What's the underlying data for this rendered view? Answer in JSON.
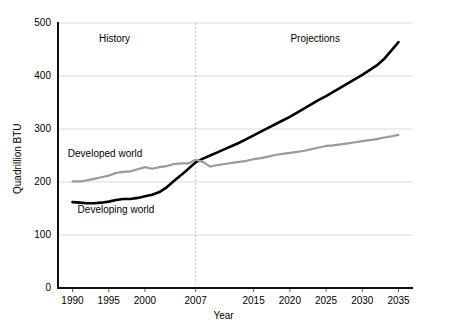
{
  "chart_data": {
    "type": "line",
    "title": "",
    "xlabel": "Year",
    "ylabel": "Quadrillion BTU",
    "xlim": [
      1988,
      2037
    ],
    "ylim": [
      0,
      500
    ],
    "grid": true,
    "legend_position": "inline-annotations",
    "x_ticks": [
      1990,
      1995,
      2000,
      2007,
      2015,
      2020,
      2025,
      2030,
      2035
    ],
    "x_tick_labels": [
      "1990",
      "1995",
      "2000",
      "2007",
      "2015",
      "2020",
      "2025",
      "2030",
      "2035"
    ],
    "y_ticks": [
      0,
      100,
      200,
      300,
      400,
      500
    ],
    "y_tick_labels": [
      "0",
      "100",
      "200",
      "300",
      "400",
      "500"
    ],
    "divider_x": 2007,
    "annotations": [
      {
        "text": "History",
        "x": 1995.8,
        "y": 470
      },
      {
        "text": "Projections",
        "x": 2023.5,
        "y": 470
      },
      {
        "text": "Developed world",
        "x": 1994.5,
        "y": 252
      },
      {
        "text": "Developing world",
        "x": 1996.0,
        "y": 148
      }
    ],
    "series": [
      {
        "name": "Developing world",
        "color": "#000000",
        "width": 2.6,
        "x": [
          1990,
          1991,
          1992,
          1993,
          1994,
          1995,
          1996,
          1997,
          1998,
          1999,
          2000,
          2001,
          2002,
          2003,
          2004,
          2005,
          2006,
          2007,
          2008,
          2009,
          2010,
          2011,
          2012,
          2013,
          2014,
          2015,
          2016,
          2017,
          2018,
          2019,
          2020,
          2021,
          2022,
          2023,
          2024,
          2025,
          2026,
          2027,
          2028,
          2029,
          2030,
          2031,
          2032,
          2033,
          2034,
          2035
        ],
        "values": [
          162,
          161,
          160,
          160,
          161,
          163,
          166,
          168,
          168,
          170,
          173,
          176,
          181,
          190,
          202,
          213,
          225,
          237,
          244,
          250,
          256,
          262,
          268,
          274,
          281,
          288,
          295,
          302,
          309,
          316,
          323,
          331,
          339,
          347,
          355,
          362,
          370,
          378,
          386,
          394,
          402,
          411,
          420,
          432,
          448,
          464
        ]
      },
      {
        "name": "Developed world",
        "color": "#9a9a9a",
        "width": 2.2,
        "x": [
          1990,
          1991,
          1992,
          1993,
          1994,
          1995,
          1996,
          1997,
          1998,
          1999,
          2000,
          2001,
          2002,
          2003,
          2004,
          2005,
          2006,
          2007,
          2008,
          2009,
          2010,
          2011,
          2012,
          2013,
          2014,
          2015,
          2016,
          2017,
          2018,
          2019,
          2020,
          2021,
          2022,
          2023,
          2024,
          2025,
          2026,
          2027,
          2028,
          2029,
          2030,
          2031,
          2032,
          2033,
          2034,
          2035
        ],
        "values": [
          201,
          201,
          203,
          206,
          209,
          212,
          217,
          219,
          220,
          224,
          228,
          225,
          228,
          230,
          234,
          235,
          235,
          242,
          238,
          229,
          232,
          234,
          236,
          238,
          240,
          243,
          245,
          248,
          251,
          253,
          255,
          257,
          259,
          262,
          265,
          268,
          269,
          271,
          273,
          275,
          277,
          279,
          281,
          284,
          286,
          289
        ]
      }
    ]
  },
  "axis": {
    "x_title": "Year",
    "y_title": "Quadrillion BTU"
  }
}
